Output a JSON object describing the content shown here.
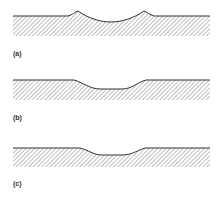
{
  "figure": {
    "panels": [
      {
        "id": "a",
        "label": "(a)",
        "description": "Surface with central depression and raised rims at both edges"
      },
      {
        "id": "b",
        "label": "(b)",
        "description": "Surface with smooth shallow depression"
      },
      {
        "id": "c",
        "label": "(c)",
        "description": "Surface with shallower, narrower depression"
      }
    ],
    "colors": {
      "surface_line": "#333333",
      "hatch": "#8a8a8a",
      "background": "#ffffff"
    }
  }
}
